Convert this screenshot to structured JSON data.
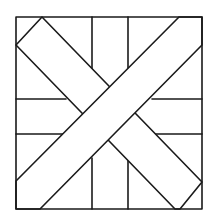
{
  "diagram": {
    "title": "",
    "colors": {
      "stroke": "#1a1a1a",
      "fill": "#ffffff",
      "background": "#ffffff"
    },
    "frame": {
      "x": 16,
      "y": 17,
      "w": 186,
      "h": 192
    },
    "band_tlbr": [
      [
        16,
        45
      ],
      [
        42,
        17
      ],
      [
        202,
        182
      ],
      [
        180,
        209
      ],
      [
        174,
        209
      ]
    ],
    "band_bltr": [
      [
        16,
        181
      ],
      [
        40,
        209
      ],
      [
        202,
        45
      ],
      [
        179,
        17
      ]
    ],
    "segments": [
      [
        92,
        17,
        92,
        68
      ],
      [
        128,
        17,
        128,
        68
      ],
      [
        16,
        99,
        70,
        99
      ],
      [
        150,
        99,
        202,
        99
      ],
      [
        16,
        134,
        66,
        134
      ],
      [
        152,
        134,
        202,
        134
      ],
      [
        92,
        157,
        92,
        209
      ],
      [
        128,
        157,
        128,
        209
      ]
    ]
  }
}
